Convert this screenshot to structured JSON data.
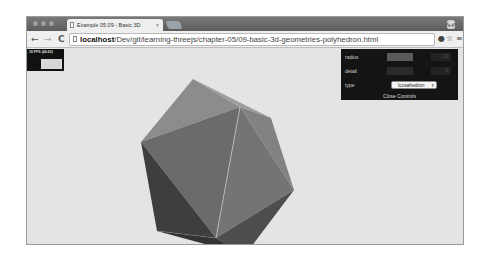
{
  "browser": {
    "tab_title": "Example 05.09 - Basic 3D",
    "tab_close": "×",
    "url_host": "localhost",
    "url_path": "/Dev/git/learning-threejs/chapter-05/09-basic-3d-geometries-polyhedron.html",
    "nav": {
      "back": "←",
      "forward": "→",
      "reload": "C"
    },
    "right_icons": {
      "extension": "●",
      "star": "☆",
      "menu": "≡"
    }
  },
  "stats": {
    "label": "30 FPS (44-60)"
  },
  "controls": {
    "radius_label": "radius",
    "radius_value": "10",
    "detail_label": "detail",
    "detail_value": "0",
    "type_label": "type",
    "type_value": "Icosahedron",
    "select_arrow": "⇕",
    "close_label": "Close Controls"
  },
  "scene": {
    "object": "icosahedron",
    "background": "#e4e4e4"
  }
}
